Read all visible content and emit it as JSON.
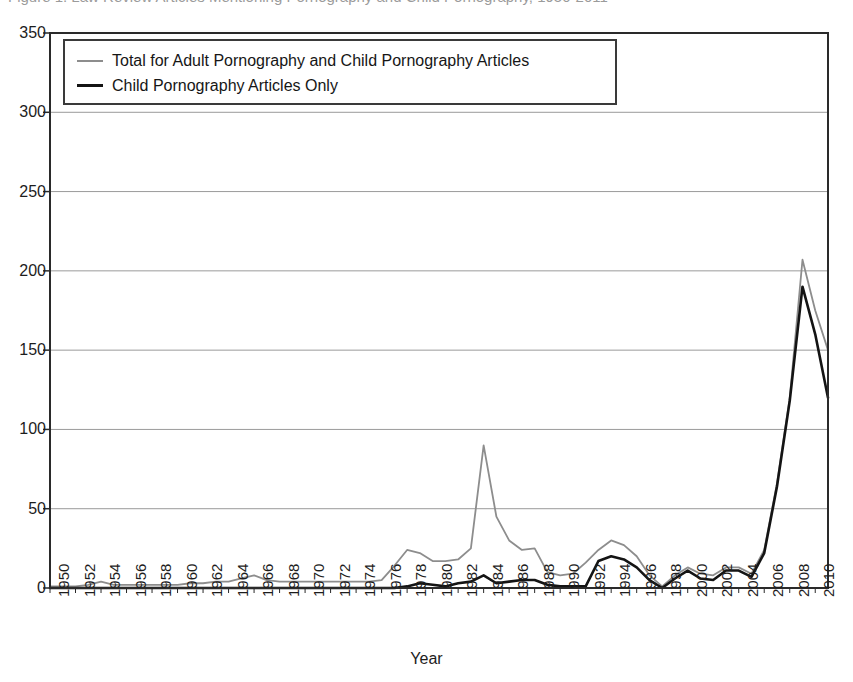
{
  "figure": {
    "title_sliver": "Figure 1.  Law Review Articles Mentioning Pornography and Child Pornography, 1950-2011",
    "xlabel": "Year"
  },
  "legend": {
    "position": "upper-left-inside",
    "entries": [
      {
        "label": "Total for Adult Pornography and Child Pornography Articles",
        "color": "#8d8d8d",
        "icon": "line-swatch-gray"
      },
      {
        "label": "Child Pornography Articles Only",
        "color": "#141414",
        "icon": "line-swatch-black"
      }
    ]
  },
  "axes": {
    "y_ticks": [
      "0",
      "50",
      "100",
      "150",
      "200",
      "250",
      "300",
      "350"
    ],
    "x_ticks": [
      "1950",
      "1952",
      "1954",
      "1956",
      "1958",
      "1960",
      "1962",
      "1964",
      "1966",
      "1968",
      "1970",
      "1972",
      "1974",
      "1976",
      "1978",
      "1980",
      "1982",
      "1984",
      "1986",
      "1988",
      "1990",
      "1992",
      "1994",
      "1996",
      "1998",
      "2000",
      "2002",
      "2004",
      "2006",
      "2008",
      "2010"
    ]
  },
  "chart_data": {
    "type": "line",
    "title": "Law Review Articles Mentioning Pornography and Child Pornography, 1950-2011",
    "xlabel": "Year",
    "ylabel": "",
    "xlim": [
      1950,
      2011
    ],
    "ylim": [
      0,
      350
    ],
    "ytick_step": 50,
    "xtick_step": 2,
    "grid": "horizontal",
    "legend_position": "upper left",
    "x": [
      1950,
      1951,
      1952,
      1953,
      1954,
      1955,
      1956,
      1957,
      1958,
      1959,
      1960,
      1961,
      1962,
      1963,
      1964,
      1965,
      1966,
      1967,
      1968,
      1969,
      1970,
      1971,
      1972,
      1973,
      1974,
      1975,
      1976,
      1977,
      1978,
      1979,
      1980,
      1981,
      1982,
      1983,
      1984,
      1985,
      1986,
      1987,
      1988,
      1989,
      1990,
      1991,
      1992,
      1993,
      1994,
      1995,
      1996,
      1997,
      1998,
      1999,
      2000,
      2001,
      2002,
      2003,
      2004,
      2005,
      2006,
      2007,
      2008,
      2009,
      2010,
      2011
    ],
    "series": [
      {
        "name": "Total for Adult Pornography and Child Pornography Articles",
        "color": "#8d8d8d",
        "values": [
          1,
          1,
          1,
          2,
          4,
          2,
          2,
          2,
          2,
          2,
          2,
          3,
          3,
          4,
          4,
          6,
          8,
          5,
          4,
          4,
          4,
          4,
          4,
          4,
          4,
          4,
          5,
          14,
          24,
          22,
          17,
          17,
          18,
          25,
          90,
          45,
          30,
          24,
          25,
          10,
          8,
          9,
          16,
          24,
          30,
          27,
          20,
          8,
          1,
          8,
          13,
          9,
          8,
          13,
          13,
          9,
          24,
          66,
          120,
          207,
          175,
          150
        ]
      },
      {
        "name": "Child Pornography Articles Only",
        "color": "#141414",
        "values": [
          0,
          0,
          0,
          0,
          0,
          0,
          0,
          0,
          0,
          0,
          0,
          0,
          0,
          0,
          0,
          0,
          0,
          0,
          0,
          0,
          0,
          0,
          0,
          0,
          0,
          0,
          0,
          0,
          1,
          3,
          2,
          1,
          3,
          4,
          8,
          3,
          4,
          5,
          5,
          2,
          1,
          1,
          1,
          17,
          20,
          18,
          13,
          5,
          0,
          6,
          11,
          6,
          5,
          11,
          11,
          7,
          22,
          64,
          118,
          190,
          160,
          120
        ]
      }
    ]
  }
}
